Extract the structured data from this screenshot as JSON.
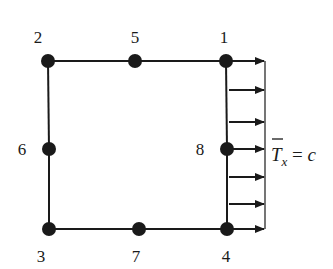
{
  "diagram": {
    "type": "8-node quadrilateral finite element with uniform traction",
    "colors": {
      "ink": "#1a1a1a",
      "background": "#ffffff"
    },
    "nodes": [
      {
        "id": "1",
        "label": "1",
        "x": 226,
        "y": 61,
        "label_pos": "above"
      },
      {
        "id": "2",
        "label": "2",
        "x": 48,
        "y": 61,
        "label_pos": "above"
      },
      {
        "id": "3",
        "label": "3",
        "x": 49,
        "y": 229,
        "label_pos": "below"
      },
      {
        "id": "4",
        "label": "4",
        "x": 227,
        "y": 229,
        "label_pos": "below"
      },
      {
        "id": "5",
        "label": "5",
        "x": 135,
        "y": 61,
        "label_pos": "above"
      },
      {
        "id": "6",
        "label": "6",
        "x": 49,
        "y": 149,
        "label_pos": "left"
      },
      {
        "id": "7",
        "label": "7",
        "x": 139,
        "y": 229,
        "label_pos": "below"
      },
      {
        "id": "8",
        "label": "8",
        "x": 227,
        "y": 149,
        "label_pos": "left"
      }
    ],
    "edges": [
      [
        "2",
        "5"
      ],
      [
        "5",
        "1"
      ],
      [
        "1",
        "8"
      ],
      [
        "8",
        "4"
      ],
      [
        "4",
        "7"
      ],
      [
        "7",
        "3"
      ],
      [
        "3",
        "6"
      ],
      [
        "6",
        "2"
      ]
    ],
    "traction": {
      "arrow_count": 7,
      "arrow_y": [
        61,
        90,
        122,
        149,
        177,
        204,
        229
      ],
      "direction": "+x",
      "label_main": "T",
      "label_sub": "x",
      "label_rest": " = c"
    }
  }
}
